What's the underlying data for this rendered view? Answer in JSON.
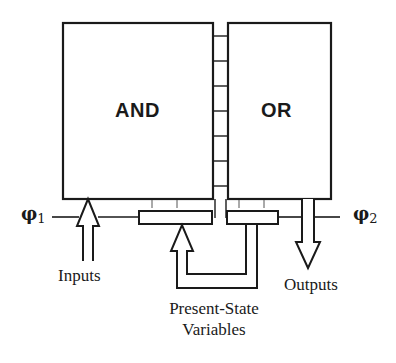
{
  "diagram": {
    "type": "PLA-based finite state machine block diagram",
    "blocks": {
      "and_plane": {
        "label": "AND"
      },
      "or_plane": {
        "label": "OR"
      }
    },
    "clocks": {
      "phi1": {
        "symbol": "φ",
        "subscript": "1"
      },
      "phi2": {
        "symbol": "φ",
        "subscript": "2"
      }
    },
    "labels": {
      "inputs": "Inputs",
      "outputs": "Outputs",
      "state_line1": "Present-State",
      "state_line2": "Variables"
    },
    "colors": {
      "stroke": "#1a1a1a",
      "background": "#ffffff"
    }
  }
}
